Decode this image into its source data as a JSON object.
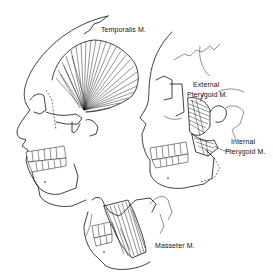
{
  "figure": {
    "labels": {
      "temporalis": "Temporalis M.",
      "external_pterygoid_line1": "External",
      "external_pterygoid_line2": "Pterygoid M.",
      "internal_pterygoid_line1": "Internal",
      "internal_pterygoid_line2": "Pterygoid M.",
      "masseter": "Masseter M."
    },
    "colors": {
      "ink": "#111111",
      "background": "#ffffff"
    }
  }
}
